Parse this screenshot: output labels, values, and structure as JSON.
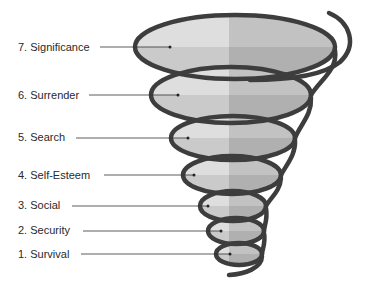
{
  "diagram": {
    "type": "spiral-funnel",
    "colors": {
      "spiral": "#3d3d3d",
      "fill_light_top": "#e3e3e3",
      "fill_light_bottom": "#cfcfcf",
      "fill_dark_top": "#c4c4c4",
      "fill_dark_bottom": "#b2b2b2",
      "leader_line": "#333333"
    },
    "levels": [
      {
        "number": 7,
        "label": "7.  Significance",
        "y": 47
      },
      {
        "number": 6,
        "label": "6.  Surrender",
        "y": 95
      },
      {
        "number": 5,
        "label": "5.  Search",
        "y": 137
      },
      {
        "number": 4,
        "label": "4.  Self-Esteem",
        "y": 175
      },
      {
        "number": 3,
        "label": "3.  Social",
        "y": 205
      },
      {
        "number": 2,
        "label": "2.  Security",
        "y": 230
      },
      {
        "number": 1,
        "label": "1.  Survival",
        "y": 254
      }
    ]
  }
}
